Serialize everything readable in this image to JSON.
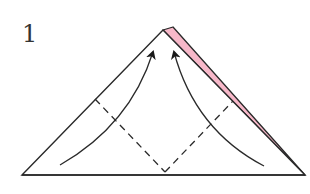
{
  "step": {
    "number": "1"
  },
  "colors": {
    "line": "#2a2a2a",
    "paper_color_side": "#f7b8c9",
    "background": "#ffffff"
  },
  "diagram": {
    "type": "origami-fold-step",
    "shape": "triangle",
    "elements": [
      "outline-triangle",
      "colored-back-layer-strip",
      "valley-fold-line-left",
      "valley-fold-line-right",
      "fold-arrow-left",
      "fold-arrow-right"
    ]
  }
}
